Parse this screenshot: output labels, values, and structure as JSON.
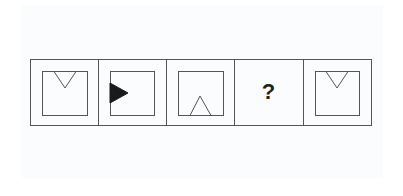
{
  "puzzle": {
    "type": "figure-sequence",
    "cells": [
      {
        "index": 1,
        "content": "square with hollow triangle pointing down at top edge"
      },
      {
        "index": 2,
        "content": "square with filled black triangle pointing right at left edge"
      },
      {
        "index": 3,
        "content": "square with hollow triangle pointing up at bottom edge"
      },
      {
        "index": 4,
        "content": "unknown",
        "label": "?"
      },
      {
        "index": 5,
        "content": "square with hollow triangle pointing down at top edge"
      }
    ],
    "question_mark": "?"
  },
  "colors": {
    "line": "#555555",
    "fill": "#1a1a1a",
    "background": "#ffffff"
  }
}
